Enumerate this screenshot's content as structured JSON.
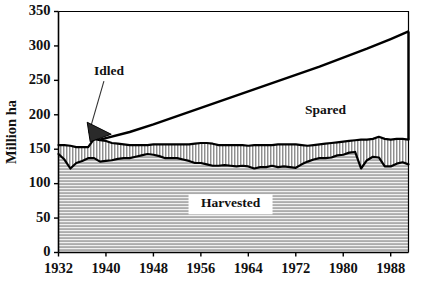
{
  "chart_data": {
    "type": "area",
    "title": "",
    "subtitle": "",
    "xlabel": "",
    "ylabel": "Million ha",
    "xlim": [
      1932,
      1991
    ],
    "ylim": [
      0,
      350
    ],
    "grid": false,
    "legend_position": "inline-annotations",
    "y_ticks": [
      0,
      50,
      100,
      150,
      200,
      250,
      300,
      350
    ],
    "y_tick_labels": [
      "0",
      "50",
      "100",
      "150",
      "200",
      "250",
      "300",
      "350"
    ],
    "x_ticks": [
      1932,
      1940,
      1948,
      1956,
      1964,
      1972,
      1980,
      1988
    ],
    "x_tick_labels": [
      "1932",
      "1940",
      "1948",
      "1956",
      "1964",
      "1972",
      "1980",
      "1988"
    ],
    "stacked": true,
    "x": [
      1932,
      1933,
      1934,
      1935,
      1936,
      1937,
      1938,
      1939,
      1940,
      1941,
      1942,
      1943,
      1944,
      1945,
      1946,
      1947,
      1948,
      1949,
      1950,
      1951,
      1952,
      1953,
      1954,
      1955,
      1956,
      1957,
      1958,
      1959,
      1960,
      1961,
      1962,
      1963,
      1964,
      1965,
      1966,
      1967,
      1968,
      1969,
      1970,
      1971,
      1972,
      1973,
      1974,
      1975,
      1976,
      1977,
      1978,
      1979,
      1980,
      1981,
      1982,
      1983,
      1984,
      1985,
      1986,
      1987,
      1988,
      1989,
      1990,
      1991
    ],
    "series": [
      {
        "name": "Harvested",
        "fill": "horizontal-hatch",
        "values": [
          143,
          135,
          122,
          130,
          133,
          137,
          137,
          132,
          133,
          134,
          136,
          137,
          137,
          139,
          141,
          143,
          142,
          140,
          137,
          137,
          137,
          135,
          133,
          130,
          130,
          128,
          126,
          126,
          127,
          126,
          125,
          126,
          125,
          122,
          124,
          124,
          126,
          124,
          125,
          124,
          123,
          128,
          132,
          135,
          137,
          137,
          138,
          141,
          142,
          145,
          146,
          122,
          134,
          139,
          138,
          125,
          125,
          129,
          131,
          128
        ]
      },
      {
        "name": "Idled",
        "fill": "vertical-hatch",
        "values": [
          13,
          21,
          33,
          23,
          20,
          16,
          28,
          31,
          29,
          25,
          22,
          20,
          19,
          17,
          15,
          13,
          15,
          17,
          20,
          20,
          20,
          22,
          24,
          28,
          29,
          31,
          32,
          30,
          29,
          30,
          31,
          30,
          30,
          34,
          32,
          32,
          30,
          33,
          32,
          33,
          34,
          28,
          23,
          21,
          20,
          21,
          21,
          19,
          19,
          17,
          17,
          42,
          30,
          26,
          30,
          40,
          39,
          36,
          34,
          36
        ]
      },
      {
        "name": "Spared",
        "fill": "white",
        "note": "Upper boundary line only; area between spared line and top of Idled band is the Spared region.",
        "x_start": 1939,
        "boundary_values": [
          {
            "year": 1939,
            "value": 164
          },
          {
            "year": 1944,
            "value": 175
          },
          {
            "year": 1948,
            "value": 186
          },
          {
            "year": 1952,
            "value": 198
          },
          {
            "year": 1956,
            "value": 210
          },
          {
            "year": 1960,
            "value": 222
          },
          {
            "year": 1964,
            "value": 234
          },
          {
            "year": 1968,
            "value": 246
          },
          {
            "year": 1972,
            "value": 258
          },
          {
            "year": 1976,
            "value": 270
          },
          {
            "year": 1980,
            "value": 283
          },
          {
            "year": 1984,
            "value": 296
          },
          {
            "year": 1988,
            "value": 310
          },
          {
            "year": 1991,
            "value": 321
          }
        ]
      }
    ],
    "annotations": [
      {
        "name": "idled-label",
        "text": "Idled",
        "x": 1940.5,
        "y": 262,
        "leader_to_x": 1940.0,
        "leader_to_y": 168
      },
      {
        "name": "spared-label",
        "text": "Spared",
        "x": 1977.0,
        "y": 205
      },
      {
        "name": "harvested-label",
        "text": "Harvested",
        "x": 1961.0,
        "y": 70
      }
    ]
  },
  "labels": {
    "y_axis_title": "Million ha",
    "idled": "Idled",
    "spared": "Spared",
    "harvested": "Harvested"
  },
  "colors": {
    "ink": "#000000",
    "background": "#ffffff",
    "harvested_fill": "#c9c9c9",
    "idled_fill": "#d8d8d8",
    "wedge_fill": "#2a2a2a"
  }
}
